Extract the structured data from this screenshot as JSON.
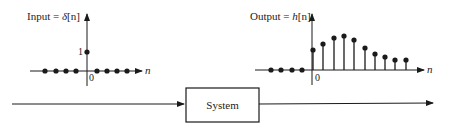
{
  "input_plot": {
    "label_prefix": "Input = ",
    "label_func": "δ",
    "label_arg": "[n]",
    "y_tick": "1",
    "origin_label": "0",
    "x_axis_label": "n",
    "left_samples": [
      0,
      0,
      0,
      0
    ],
    "impulse_value": 1,
    "right_samples": [
      0,
      0,
      0,
      0
    ]
  },
  "output_plot": {
    "label_prefix": "Output = ",
    "label_func": "h",
    "label_arg": "[n]",
    "origin_label": "0",
    "x_axis_label": "n",
    "left_samples": [
      0,
      0,
      0,
      0
    ],
    "stem_heights_px": [
      20,
      26,
      32,
      34,
      30,
      22,
      16,
      13,
      10,
      10
    ]
  },
  "system_block": {
    "label": "System"
  },
  "colors": {
    "ink": "#1a1a1a",
    "background": "#ffffff"
  }
}
